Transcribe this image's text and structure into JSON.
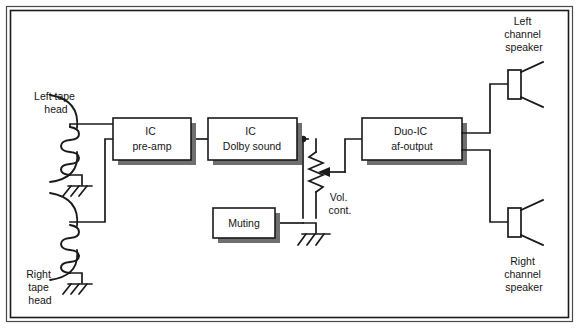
{
  "diagram": {
    "frame": {
      "style": "rectangular border"
    },
    "blocks": [
      {
        "id": "preamp",
        "line1": "IC",
        "line2": "pre-amp",
        "x": 113,
        "y": 118,
        "w": 78,
        "h": 42
      },
      {
        "id": "dolby",
        "line1": "IC",
        "line2": "Dolby sound",
        "x": 208,
        "y": 118,
        "w": 89,
        "h": 42
      },
      {
        "id": "muting",
        "line1": "Muting",
        "line2": "",
        "x": 213,
        "y": 208,
        "w": 62,
        "h": 30
      },
      {
        "id": "duoic",
        "line1": "Duo-IC",
        "line2": "af-output",
        "x": 362,
        "y": 118,
        "w": 100,
        "h": 42
      }
    ],
    "labels": {
      "left_tape_head": [
        "Left tape",
        "head"
      ],
      "right_tape_head": [
        "Right",
        "tape",
        "head"
      ],
      "left_speaker": [
        "Left",
        "channel",
        "speaker"
      ],
      "right_speaker": [
        "Right",
        "channel",
        "speaker"
      ],
      "volume_control": [
        "Vol.",
        "cont."
      ]
    },
    "components": [
      {
        "id": "left-tape-head",
        "type": "tape-head"
      },
      {
        "id": "right-tape-head",
        "type": "tape-head"
      },
      {
        "id": "volume-pot",
        "type": "potentiometer"
      },
      {
        "id": "left-speaker",
        "type": "loudspeaker"
      },
      {
        "id": "right-speaker",
        "type": "loudspeaker"
      },
      {
        "id": "ground-left-head",
        "type": "chassis-ground"
      },
      {
        "id": "ground-right-head",
        "type": "chassis-ground"
      },
      {
        "id": "ground-volume-pot",
        "type": "chassis-ground"
      }
    ],
    "colors": {
      "line": "#1a1a1a",
      "shadow": "#6f6f6f",
      "background": "#ffffff"
    }
  }
}
